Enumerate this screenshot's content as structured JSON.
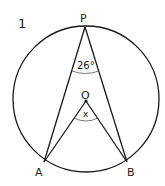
{
  "question_number": "1",
  "points": {
    "P": {
      "label": "P",
      "x": 85,
      "y": 27
    },
    "O": {
      "label": "O",
      "x": 86,
      "y": 101
    },
    "A": {
      "label": "A",
      "x": 44,
      "y": 162
    },
    "B": {
      "label": "B",
      "x": 127,
      "y": 162
    }
  },
  "circle": {
    "cx": 86,
    "cy": 99,
    "r": 73
  },
  "angles": {
    "at_P": {
      "label": "26°"
    },
    "at_O": {
      "label": "x"
    }
  },
  "colors": {
    "stroke": "#1a1a1a",
    "arc": "#555555"
  }
}
